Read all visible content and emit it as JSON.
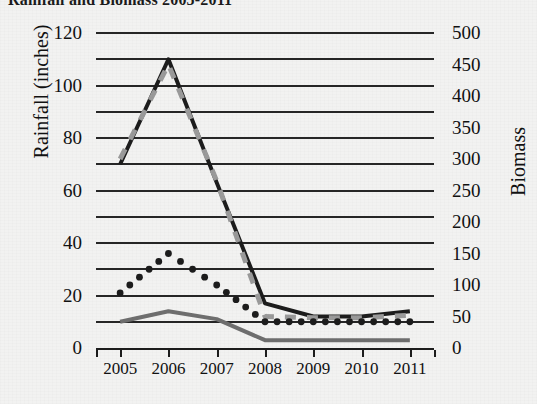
{
  "chart_data": {
    "type": "line",
    "title": "Rainfall and Biomass 2005-2011",
    "xlabel": "",
    "ylabel": "Rainfall (inches)",
    "y2label": "Biomass",
    "categories": [
      "2005",
      "2006",
      "2007",
      "2008",
      "2009",
      "2010",
      "2011"
    ],
    "x_tick_labels": [
      "2005",
      "2006",
      "2007",
      "2008",
      "2009",
      "2010",
      "2011"
    ],
    "ylim": [
      0,
      120
    ],
    "y_tick_labels": [
      "0",
      "20",
      "40",
      "60",
      "80",
      "100",
      "120"
    ],
    "y_ticks": [
      0,
      20,
      40,
      60,
      80,
      100,
      120
    ],
    "y2lim": [
      0,
      500
    ],
    "y2_tick_labels": [
      "0",
      "50",
      "100",
      "150",
      "200",
      "250",
      "300",
      "350",
      "400",
      "450",
      "500"
    ],
    "y2_ticks": [
      0,
      50,
      100,
      150,
      200,
      250,
      300,
      350,
      400,
      450,
      500
    ],
    "grid": true,
    "gridlines_at": [
      0,
      10,
      20,
      30,
      40,
      50,
      60,
      70,
      80,
      90,
      100,
      110,
      120
    ],
    "legend": "none",
    "legend_position": "none",
    "series": [
      {
        "name": "series-black-solid",
        "style": "solid",
        "color": "#1c1c1c",
        "axis": "left",
        "values": [
          70,
          110,
          63,
          17,
          12,
          12,
          14
        ]
      },
      {
        "name": "series-gray-dashed",
        "style": "dashed",
        "color": "#9a9a9a",
        "axis": "right",
        "values": [
          300,
          450,
          265,
          50,
          48,
          48,
          52
        ]
      },
      {
        "name": "series-black-dotted",
        "style": "dotted",
        "color": "#1c1c1c",
        "axis": "left",
        "values": [
          21,
          36,
          24,
          10,
          10,
          10,
          10
        ]
      },
      {
        "name": "series-gray-solid",
        "style": "solid",
        "color": "#6e6e6e",
        "axis": "left",
        "values": [
          10,
          14,
          11,
          3,
          3,
          3,
          3
        ]
      }
    ]
  }
}
